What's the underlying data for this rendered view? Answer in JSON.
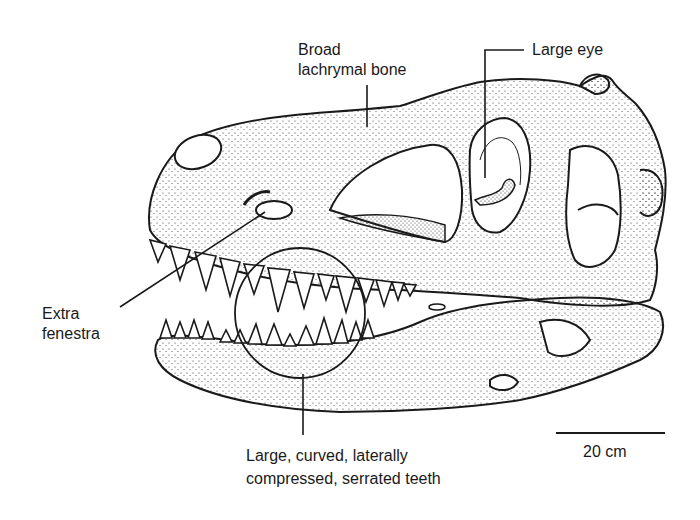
{
  "figure": {
    "labels": {
      "lachrymal": {
        "line1": "Broad",
        "line2": "lachrymal bone"
      },
      "eye": {
        "text": "Large eye"
      },
      "fenestra": {
        "line1": "Extra",
        "line2": "fenestra"
      },
      "teeth": {
        "line1": "Large, curved, laterally",
        "line2": "compressed, serrated teeth"
      }
    },
    "scale_bar": {
      "label": "20 cm"
    }
  },
  "colors": {
    "ink": "#1a1a1a",
    "background": "#ffffff"
  }
}
